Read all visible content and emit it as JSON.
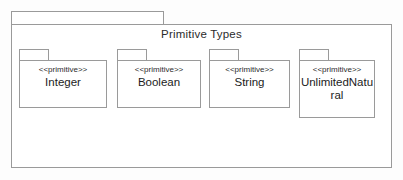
{
  "diagram": {
    "type": "uml-package-diagram",
    "background_color": "#fdfdfd",
    "border_color": "#9a9a9a",
    "fill_color": "#ffffff",
    "text_color": "#1c1c1c"
  },
  "package": {
    "title": "Primitive Types"
  },
  "primitives": [
    {
      "stereotype": "<<primitive>>",
      "name": "Integer",
      "left": 19,
      "top": 49,
      "tab_width": 30,
      "body_width": 88,
      "body_height": 48
    },
    {
      "stereotype": "<<primitive>>",
      "name": "Boolean",
      "left": 117,
      "top": 49,
      "tab_width": 30,
      "body_width": 84,
      "body_height": 48
    },
    {
      "stereotype": "<<primitive>>",
      "name": "String",
      "left": 209,
      "top": 49,
      "tab_width": 30,
      "body_width": 81,
      "body_height": 48
    },
    {
      "stereotype": "<<primitive>>",
      "name": "UnlimitedNatural",
      "left": 299,
      "top": 49,
      "tab_width": 30,
      "body_width": 76,
      "body_height": 58
    }
  ]
}
